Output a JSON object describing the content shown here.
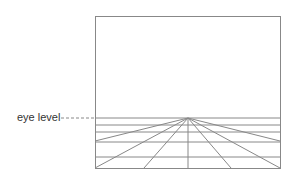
{
  "diagram": {
    "label": "eye level",
    "colors": {
      "line": "#888888",
      "text": "#333333"
    },
    "frame": {
      "x": 95,
      "y": 16,
      "width": 185,
      "height": 152
    },
    "vanishing_point": {
      "x": 188,
      "y": 118
    },
    "horizontal_lines_y": [
      118,
      125,
      132,
      142,
      157,
      168
    ],
    "rays_to_bottom_x": [
      95,
      144,
      188,
      231,
      280
    ],
    "rays_to_sides_y": [
      141
    ]
  }
}
